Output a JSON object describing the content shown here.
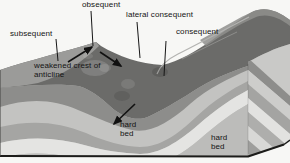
{
  "labels": {
    "obsequent": "obsequent",
    "lateral_consequent": "lateral consequent",
    "subsequent": "subsequent",
    "consequent": "consequent",
    "weakened_crest_of_anticline": "weakened crest of anticline",
    "hard_bed_front": "hard bed",
    "hard_bed_side": "hard bed"
  },
  "icons": {
    "crest_arrow": "arrow-up-right",
    "obsequent_flow_arrow": "arrow-down-right",
    "hard_bed_arrow": "arrow-down-left"
  },
  "colors": {
    "background": "#f7f7f5",
    "terrain_surface": "#6b6b69",
    "left_slope": "#9b9b99",
    "hard_bed_band": "#8d8d8b",
    "light_band": "#c3c3c1",
    "medium_band": "#a5a5a3",
    "white_band": "#e4e4e2",
    "outline": "#1c1c1a",
    "label_text": "#141414"
  }
}
